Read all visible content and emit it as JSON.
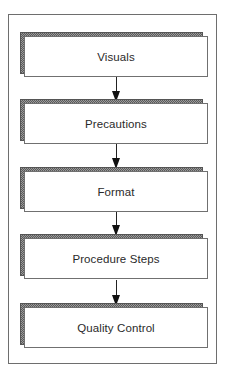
{
  "diagram": {
    "type": "flowchart",
    "direction": "top-to-bottom",
    "steps": [
      {
        "label": "Visuals"
      },
      {
        "label": "Precautions"
      },
      {
        "label": "Format"
      },
      {
        "label": "Procedure Steps"
      },
      {
        "label": "Quality Control"
      }
    ],
    "connectors": [
      {
        "from": "Visuals",
        "to": "Precautions"
      },
      {
        "from": "Precautions",
        "to": "Format"
      },
      {
        "from": "Format",
        "to": "Procedure Steps"
      },
      {
        "from": "Procedure Steps",
        "to": "Quality Control"
      }
    ],
    "colors": {
      "frame_border": "#6e6e6e",
      "box_fill": "#ffffff",
      "box_border": "#707070",
      "shadow_pattern": "#5a5a5a",
      "text": "#2a2a2a",
      "arrow": "#111111"
    }
  }
}
